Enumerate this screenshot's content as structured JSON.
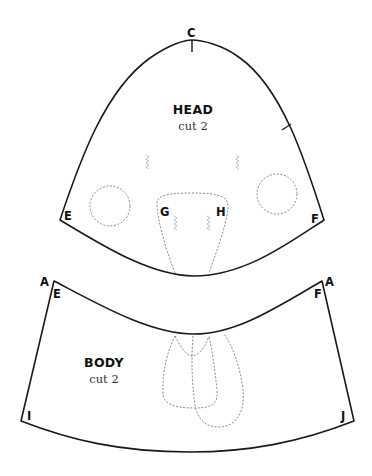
{
  "diagram": {
    "type": "sewing-pattern",
    "pieces": [
      {
        "name": "HEAD",
        "instruction": "cut 2",
        "labels": {
          "top": "C",
          "left_corner": "E",
          "right_corner": "F",
          "inner_left": "G",
          "inner_right": "H"
        }
      },
      {
        "name": "BODY",
        "instruction": "cut 2",
        "labels": {
          "top_left_outer": "A",
          "top_left_inner": "E",
          "top_right_outer": "A",
          "top_right_inner": "F",
          "bottom_left": "I",
          "bottom_right": "J"
        }
      }
    ],
    "colors": {
      "cut_line": "#1a1a1a",
      "placement_line": "#8a8a8a",
      "dart_marks": "#b8b8b8",
      "background": "#ffffff"
    }
  }
}
